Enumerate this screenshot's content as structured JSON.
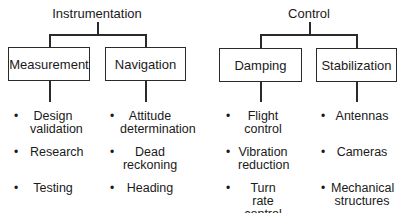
{
  "diagram": {
    "type": "tree",
    "groups": [
      {
        "title": "Instrumentation",
        "children": [
          {
            "label": "Measurement",
            "items": [
              [
                "Design",
                "validation"
              ],
              [
                "Research"
              ],
              [
                "Testing"
              ]
            ]
          },
          {
            "label": "Navigation",
            "items": [
              [
                "Attitude",
                "determination"
              ],
              [
                "Dead",
                "reckoning"
              ],
              [
                "Heading"
              ]
            ]
          }
        ]
      },
      {
        "title": "Control",
        "children": [
          {
            "label": "Damping",
            "items": [
              [
                "Flight",
                "control"
              ],
              [
                "Vibration",
                "reduction"
              ],
              [
                "Turn rate",
                "control"
              ]
            ]
          },
          {
            "label": "Stabilization",
            "items": [
              [
                "Antennas"
              ],
              [
                "Cameras"
              ],
              [
                "Mechanical",
                "structures"
              ]
            ]
          }
        ]
      }
    ],
    "bullet": "•",
    "colors": {
      "line": "#2a2a2a",
      "text": "#1a1a1a",
      "background": "#ffffff"
    }
  }
}
